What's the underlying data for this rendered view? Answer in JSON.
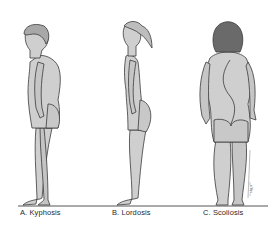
{
  "figure": {
    "type": "medical-illustration",
    "panels": [
      {
        "letter": "A",
        "label": "A. Kyphosis",
        "view": "side-profile",
        "figure": "male"
      },
      {
        "letter": "B",
        "label": "B. Lordosis",
        "view": "side-profile",
        "figure": "female"
      },
      {
        "letter": "C",
        "label": "C. Scoliosis",
        "view": "posterior",
        "figure": "female"
      }
    ],
    "signature": "artist-signature"
  },
  "colors": {
    "background": "#ffffff",
    "skin": "#cfcfcf",
    "skin_shadow": "#b5b5b5",
    "outline": "#3a3a3a",
    "hair_a": "#a8a8a8",
    "hair_b": "#bdbdbd",
    "hair_c": "#6a6a6a",
    "ground": "#555555",
    "label_text": "#2a2a2a"
  }
}
